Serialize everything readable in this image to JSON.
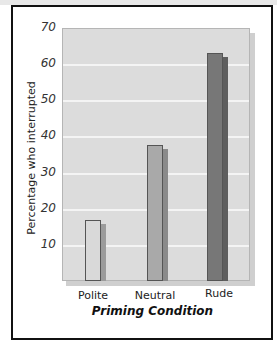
{
  "chart_data": {
    "type": "bar",
    "title": "",
    "xlabel": "Priming Condition",
    "ylabel": "Percentage who interrupted",
    "categories": [
      "Polite",
      "Neutral",
      "Rude"
    ],
    "values": [
      17,
      37.5,
      63
    ],
    "ylim": [
      0,
      70
    ],
    "yticks": [
      10,
      20,
      30,
      40,
      50,
      60,
      70
    ],
    "grid": true,
    "legend": null,
    "bar_colors": [
      "#d9d9d9",
      "#a9a9a9",
      "#777777"
    ]
  },
  "labels": {
    "xlabel": "Priming Condition",
    "ylabel": "Percentage who interrupted",
    "yticks": [
      "10",
      "20",
      "30",
      "40",
      "50",
      "60",
      "70"
    ],
    "categories": [
      "Polite",
      "Neutral",
      "Rude"
    ]
  }
}
